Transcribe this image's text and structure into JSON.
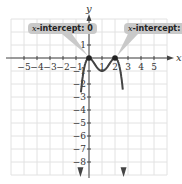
{
  "chart_data": {
    "type": "line",
    "title": "",
    "xlabel": "x",
    "ylabel": "y",
    "xlim": [
      -6,
      6
    ],
    "ylim": [
      -9,
      3
    ],
    "grid": true,
    "x_ticks": [
      -5,
      -4,
      -3,
      -2,
      -1,
      1,
      2,
      3,
      4,
      5
    ],
    "y_ticks": [
      1,
      -1,
      -2,
      -3,
      -4,
      -5,
      -6,
      -7,
      -8
    ],
    "x_tick_labels": [
      "−5",
      "−4",
      "−3",
      "−2",
      "−1",
      "1",
      "2",
      "3",
      "4",
      "5"
    ],
    "y_tick_labels": [
      "1",
      "−1",
      "−2",
      "−3",
      "−4",
      "−5",
      "−6",
      "−7",
      "−8"
    ],
    "series": [
      {
        "name": "f(x)",
        "color": "#444444",
        "x": [
          -0.6,
          -0.5,
          -0.4,
          -0.3,
          -0.2,
          -0.1,
          0,
          0.25,
          0.5,
          0.75,
          1,
          1.25,
          1.5,
          1.75,
          2,
          2.1,
          2.2,
          2.3,
          2.4,
          2.5,
          2.6
        ],
        "y": [
          -8.0,
          -6.25,
          -3.69,
          -1.95,
          -0.77,
          -0.19,
          0,
          -0.19,
          -0.56,
          -0.88,
          -1.0,
          -0.88,
          -0.56,
          -0.19,
          0,
          -0.05,
          -0.21,
          -0.48,
          -0.92,
          -1.56,
          -3.7
        ]
      }
    ],
    "points": [
      {
        "x": 0,
        "y": 0,
        "label": "x-intercept: 0"
      },
      {
        "x": 2,
        "y": 0,
        "label": "x-intercept: 2"
      }
    ],
    "annotations": [
      {
        "text_prefix": "x",
        "text": "-intercept: 0",
        "target": [
          0,
          0
        ]
      },
      {
        "text_prefix": "x",
        "text": "-intercept: 2",
        "target": [
          2,
          0
        ]
      }
    ]
  },
  "callouts": {
    "left": {
      "var": "x",
      "text": "-intercept: 0"
    },
    "right": {
      "var": "x",
      "text": "-intercept: 2"
    }
  },
  "axes": {
    "x_label": "x",
    "y_label": "y"
  }
}
